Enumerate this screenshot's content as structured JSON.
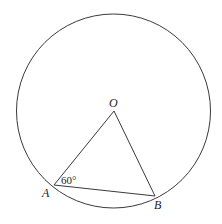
{
  "diagram": {
    "type": "geometry",
    "colors": {
      "stroke": "#3a3a3a",
      "text": "#222222",
      "background": "#ffffff"
    },
    "circle": {
      "cx": 113.5,
      "cy": 111,
      "r": 97
    },
    "points": {
      "O": {
        "label": "O",
        "x": 114,
        "y": 111
      },
      "A": {
        "label": "A",
        "x": 54,
        "y": 185
      },
      "B": {
        "label": "B",
        "x": 155,
        "y": 196
      }
    },
    "segments": [
      {
        "from": "O",
        "to": "A"
      },
      {
        "from": "O",
        "to": "B"
      },
      {
        "from": "A",
        "to": "B"
      }
    ],
    "angle_label": {
      "vertex": "A",
      "text": "60°"
    }
  }
}
